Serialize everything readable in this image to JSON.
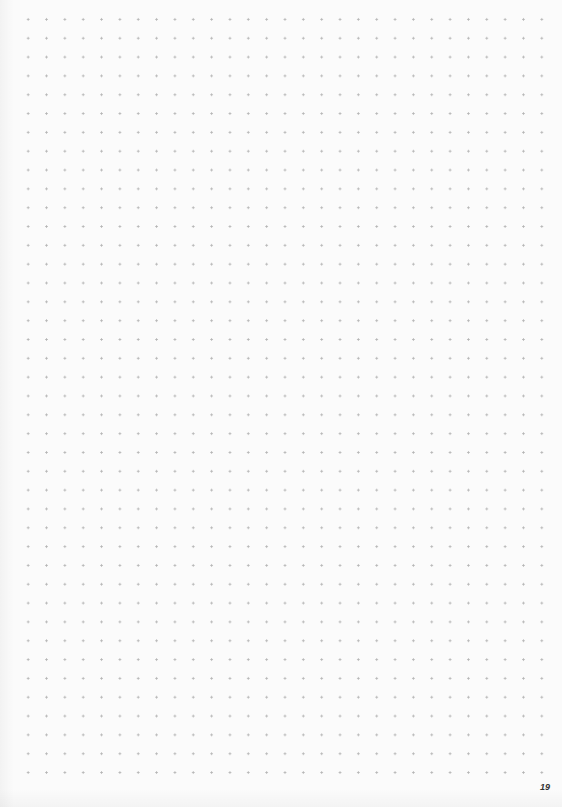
{
  "page": {
    "type": "dot-grid notebook page",
    "page_number": "19",
    "grid": {
      "columns": 30,
      "rows": 42,
      "dot_color": "#b4b4b4",
      "background_color": "#fbfbfb"
    }
  }
}
